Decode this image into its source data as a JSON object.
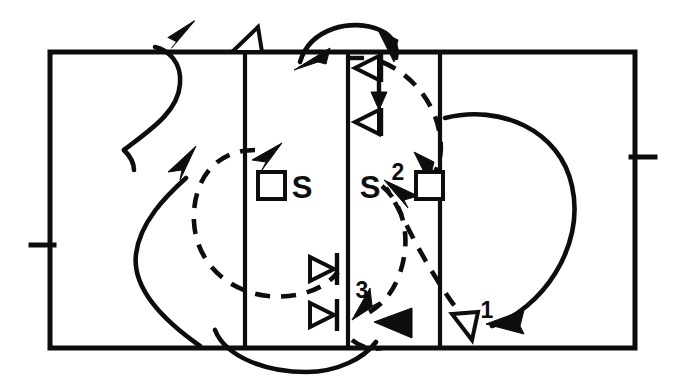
{
  "diagram": {
    "type": "sports-play-diagram",
    "background_color": "#ffffff",
    "ink_color": "#0d0d0d",
    "court": {
      "name": "volleyball-court",
      "outline": {
        "x": 50,
        "y": 52,
        "width": 585,
        "height": 296
      },
      "vertical_dividers_x": [
        245,
        348,
        440
      ],
      "side_ticks": [
        {
          "name": "left-sideline-tick",
          "x1": 31,
          "y1": 245,
          "x2": 52,
          "y2": 245
        },
        {
          "name": "right-sideline-tick",
          "x1": 633,
          "y1": 157,
          "x2": 655,
          "y2": 157
        }
      ]
    },
    "labels": {
      "setter_left": "S",
      "setter_right": "S",
      "route_one": "1",
      "route_two": "2",
      "route_three": "3"
    },
    "players": [
      {
        "name": "player-square-left",
        "label": "",
        "x": 258,
        "y": 172,
        "size": 27
      },
      {
        "name": "player-square-right",
        "label": "",
        "x": 416,
        "y": 172,
        "size": 27
      }
    ],
    "markers": [
      {
        "name": "blocker-marker-top-upper",
        "direction": "left",
        "x": 360,
        "y": 60
      },
      {
        "name": "blocker-marker-top-lower",
        "direction": "left",
        "x": 360,
        "y": 110
      },
      {
        "name": "blocker-marker-bottom-upper",
        "direction": "right",
        "x": 310,
        "y": 258
      },
      {
        "name": "blocker-marker-bottom-lower",
        "direction": "right",
        "x": 310,
        "y": 303
      }
    ],
    "paths": [
      {
        "name": "path-serve-arc-right",
        "style": "solid",
        "label": "1",
        "description": "large arc from net down around right side to arrowhead pointing left"
      },
      {
        "name": "path-dashed-right-loop",
        "style": "dashed",
        "label": "2",
        "description": "dashed loop from bottom right up to right setter square"
      },
      {
        "name": "path-dashed-middle-loop",
        "style": "dashed",
        "label": "3",
        "description": "dashed loop in middle right zone"
      },
      {
        "name": "path-dashed-left-loop",
        "style": "dashed",
        "label": "",
        "description": "dashed oval loop around left setter"
      },
      {
        "name": "path-solid-left-upper-s",
        "style": "solid",
        "label": "",
        "description": "S-curve rising to top boundary with arrowhead"
      },
      {
        "name": "path-solid-left-lower-s",
        "style": "solid",
        "label": "",
        "description": "S-curve rising from bottom with arrowhead"
      },
      {
        "name": "path-solid-top-hook",
        "style": "solid",
        "label": "",
        "description": "hook over the net at top center"
      },
      {
        "name": "path-solid-bottom-dip",
        "style": "solid",
        "label": "",
        "description": "curve dipping below bottom boundary"
      }
    ],
    "arrowheads": [
      {
        "name": "arrowhead-top-left-solid",
        "fill": "solid",
        "points_to": "up-right"
      },
      {
        "name": "arrowhead-top-hollow",
        "fill": "hollow",
        "points_to": "up-right"
      },
      {
        "name": "arrowhead-top-center-solid",
        "fill": "solid",
        "points_to": "down-left"
      },
      {
        "name": "arrowhead-top-right-solid",
        "fill": "solid",
        "points_to": "down-right"
      },
      {
        "name": "arrowhead-mid-left-solid",
        "fill": "solid",
        "points_to": "up-right"
      },
      {
        "name": "arrowhead-left-setter-solid",
        "fill": "solid",
        "points_to": "up-right"
      },
      {
        "name": "arrowhead-right-setter-solid",
        "fill": "solid",
        "points_to": "up-left"
      },
      {
        "name": "arrowhead-into-square-solid",
        "fill": "solid",
        "points_to": "down-right"
      },
      {
        "name": "arrowhead-net-down-solid",
        "fill": "solid",
        "points_to": "down"
      },
      {
        "name": "arrowhead-three-solid",
        "fill": "solid",
        "points_to": "down-left"
      },
      {
        "name": "arrowhead-bottom-mid-solid",
        "fill": "solid",
        "points_to": "left"
      },
      {
        "name": "arrowhead-one-solid",
        "fill": "solid",
        "points_to": "left"
      },
      {
        "name": "arrowhead-bottom-right-hollow",
        "fill": "hollow",
        "points_to": "up-left"
      }
    ]
  }
}
